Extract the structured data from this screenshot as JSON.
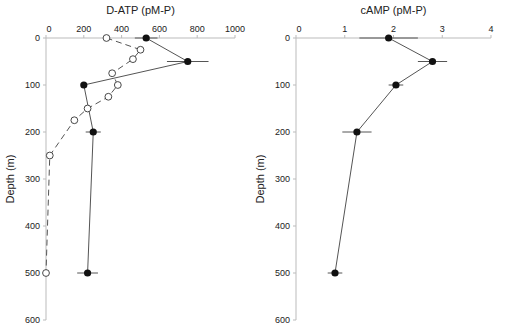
{
  "chart_data": [
    {
      "type": "line",
      "title": "D-ATP (pM-P)",
      "xlabel": "D-ATP (pM-P)",
      "ylabel": "Depth (m)",
      "xlim": [
        0,
        1000
      ],
      "ylim": [
        600,
        0
      ],
      "x_ticks": [
        "0",
        "200",
        "400",
        "600",
        "800",
        "1000"
      ],
      "y_ticks": [
        "0",
        "100",
        "200",
        "300",
        "400",
        "500",
        "600"
      ],
      "grid": false,
      "x_axis_position": "top",
      "series": [
        {
          "name": "filled",
          "marker": "filled-circle",
          "line": "solid",
          "points": [
            {
              "x": 530,
              "y": 0,
              "xerr": 60
            },
            {
              "x": 750,
              "y": 50,
              "xerr": 110
            },
            {
              "x": 200,
              "y": 100,
              "xerr": 0
            },
            {
              "x": 250,
              "y": 200,
              "xerr": 40
            },
            {
              "x": 220,
              "y": 500,
              "xerr": 55
            }
          ]
        },
        {
          "name": "open",
          "marker": "open-circle",
          "line": "dashed",
          "points": [
            {
              "x": 320,
              "y": 0
            },
            {
              "x": 500,
              "y": 25
            },
            {
              "x": 460,
              "y": 45
            },
            {
              "x": 350,
              "y": 75
            },
            {
              "x": 380,
              "y": 100
            },
            {
              "x": 330,
              "y": 125
            },
            {
              "x": 220,
              "y": 150
            },
            {
              "x": 150,
              "y": 175
            },
            {
              "x": 20,
              "y": 250
            },
            {
              "x": 0,
              "y": 500
            }
          ]
        }
      ]
    },
    {
      "type": "line",
      "title": "cAMP (pM-P)",
      "xlabel": "cAMP (pM-P)",
      "ylabel": "Depth (m)",
      "xlim": [
        0,
        4
      ],
      "ylim": [
        600,
        0
      ],
      "x_ticks": [
        "0",
        "1",
        "2",
        "3",
        "4"
      ],
      "y_ticks": [
        "0",
        "100",
        "200",
        "300",
        "400",
        "500",
        "600"
      ],
      "grid": false,
      "x_axis_position": "top",
      "series": [
        {
          "name": "filled",
          "marker": "filled-circle",
          "line": "solid",
          "points": [
            {
              "x": 1.9,
              "y": 0,
              "xerr": 0.6
            },
            {
              "x": 2.8,
              "y": 50,
              "xerr": 0.3
            },
            {
              "x": 2.05,
              "y": 100,
              "xerr": 0.15
            },
            {
              "x": 1.25,
              "y": 200,
              "xerr": 0.3
            },
            {
              "x": 0.8,
              "y": 500,
              "xerr": 0.15
            }
          ]
        }
      ]
    }
  ],
  "labels": {
    "left_title": "D-ATP (pM-P)",
    "right_title": "cAMP (pM-P)",
    "ylabel": "Depth (m)"
  },
  "colors": {
    "axis": "#bbbbbb",
    "line": "#555555",
    "marker": "#111111"
  }
}
